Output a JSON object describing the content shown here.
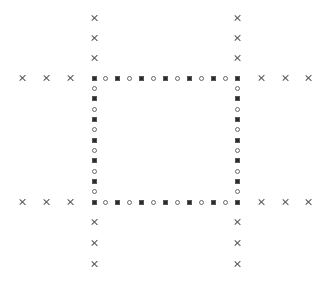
{
  "diagram": {
    "title": "",
    "background": "#ffffff",
    "colors": {
      "square_fill": "#2b2b2b",
      "circle_stroke": "#6a6a6a",
      "cross_stroke": "#555555"
    },
    "frame": {
      "left": 94,
      "right": 237,
      "top": 78,
      "bottom": 202,
      "markers_per_side": 13,
      "pattern": [
        "square",
        "circle"
      ]
    },
    "crosses": {
      "left": [
        {
          "x": 22
        },
        {
          "x": 46
        },
        {
          "x": 70
        }
      ],
      "right": [
        {
          "x": 261
        },
        {
          "x": 285
        },
        {
          "x": 308
        }
      ],
      "top": [
        {
          "y": 18
        },
        {
          "y": 38
        },
        {
          "y": 58
        }
      ],
      "bottom": [
        {
          "y": 222
        },
        {
          "y": 243
        },
        {
          "y": 264
        }
      ]
    }
  }
}
